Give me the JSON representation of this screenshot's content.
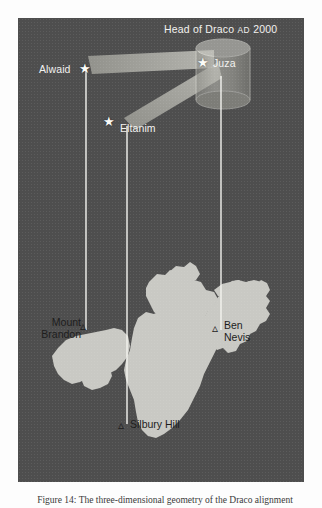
{
  "figure": {
    "title_main": "Head of Draco",
    "title_era": "AD",
    "title_year": "2000",
    "panel_bg_color": "#4e4e4e",
    "land_color": "#c9c9c4",
    "sightline_color": "#f4f4f0",
    "beam_color": "#b9b9b2"
  },
  "stars": [
    {
      "id": "alwaid",
      "label": "Alwaid",
      "glyph": "star-icon",
      "label_side": "left"
    },
    {
      "id": "juza",
      "label": "Juza",
      "glyph": "star-icon",
      "label_side": "right"
    },
    {
      "id": "eltanim",
      "label": "Eltanim",
      "glyph": "star-icon",
      "label_side": "right"
    }
  ],
  "landmarks": [
    {
      "id": "mount-brandon",
      "line1": "Mount",
      "line2": "Brandon",
      "glyph": "peak-icon"
    },
    {
      "id": "ben-nevis",
      "line1": "Ben",
      "line2": "Nevis",
      "glyph": "peak-icon"
    },
    {
      "id": "silbury-hill",
      "line1": "Silbury Hill",
      "line2": "",
      "glyph": "peak-icon"
    }
  ],
  "sightlines": [
    {
      "from": "alwaid",
      "to": "mount-brandon"
    },
    {
      "from": "eltanim",
      "to": "silbury-hill"
    },
    {
      "from": "juza",
      "to": "ben-nevis"
    }
  ],
  "caption": {
    "text": "Figure 14: The three-dimensional geometry of the Draco alignment"
  }
}
